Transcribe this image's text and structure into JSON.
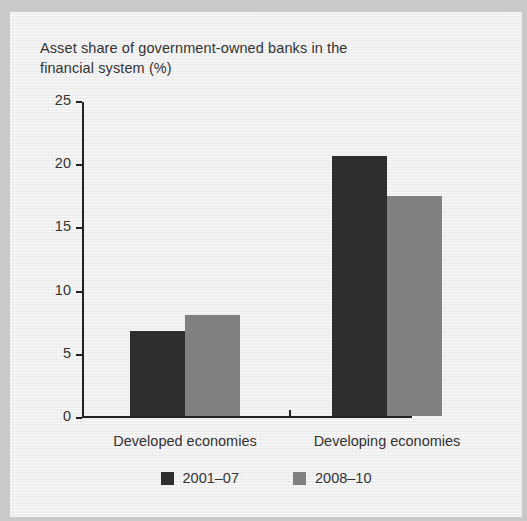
{
  "chart_data": {
    "type": "bar",
    "title": "Asset share of government-owned banks in the financial system (%)",
    "xlabel": "",
    "ylabel": "",
    "ylim": [
      0,
      25
    ],
    "yticks": [
      0,
      5,
      10,
      15,
      20,
      25
    ],
    "ytick_labels": [
      "0",
      "5",
      "10",
      "15",
      "20",
      "25"
    ],
    "grid": false,
    "legend_position": "bottom",
    "categories": [
      "Developed economies",
      "Developing economies"
    ],
    "series": [
      {
        "name": "2001–07",
        "color": "#2e2e2e",
        "values": [
          6.7,
          20.6
        ]
      },
      {
        "name": "2008–10",
        "color": "#808080",
        "values": [
          8.0,
          17.4
        ]
      }
    ]
  },
  "title_lines": [
    "Asset share of government-owned banks in the",
    "financial system (%)"
  ],
  "colors": {
    "background": "#f1f1f1",
    "page_margin": "#c9c9c9",
    "axis": "#222222",
    "text": "#333333",
    "series_1": "#2e2e2e",
    "series_2": "#808080"
  }
}
